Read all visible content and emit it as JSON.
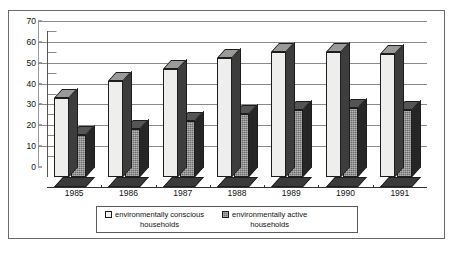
{
  "chart_data": {
    "type": "bar",
    "title": "",
    "subtitle": "",
    "xlabel": "",
    "ylabel": "",
    "categories": [
      "1985",
      "1986",
      "1987",
      "1988",
      "1989",
      "1990",
      "1991"
    ],
    "series": [
      {
        "name": "environmentally conscious households",
        "values": [
          38,
          46,
          52,
          57,
          60,
          60,
          59
        ],
        "swatch": "light",
        "color": "#eeeeec"
      },
      {
        "name": "environmentally active households",
        "values": [
          20,
          23,
          27,
          30,
          32,
          33,
          32
        ],
        "swatch": "dark",
        "color": "#6d6d6d"
      }
    ],
    "ylim": [
      0,
      70
    ],
    "yticks": [
      0,
      10,
      20,
      30,
      40,
      50,
      60,
      70
    ],
    "ytick_labels": [
      "0",
      "10",
      "20",
      "30",
      "40",
      "50",
      "60",
      "70"
    ],
    "grid": true,
    "grid_axis": "y",
    "legend_position": "bottom",
    "three_d": true
  },
  "legend": {
    "entries": [
      {
        "line1": "environmentally conscious",
        "line2": "households"
      },
      {
        "line1": "environmentally active",
        "line2": "households"
      }
    ]
  },
  "colors": {
    "frame": "#6b6b6b",
    "grid": "#8a8a8a",
    "axis": "#333333",
    "series_light": "#eeeeec",
    "series_dark": "#6d6d6d",
    "text": "#111111"
  }
}
